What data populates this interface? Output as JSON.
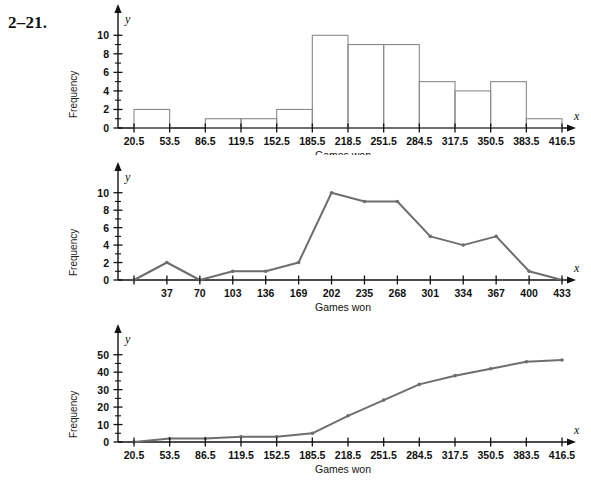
{
  "exercise": {
    "label": "2–21."
  },
  "axis_letters": {
    "x": "x",
    "y": "y"
  },
  "common": {
    "ylabel": "Frequency",
    "xlabel": "Games won"
  },
  "chart_data": [
    {
      "type": "bar",
      "name": "histogram",
      "title": "",
      "xlabel": "Games won",
      "ylabel": "Frequency",
      "boundaries": [
        20.5,
        53.5,
        86.5,
        119.5,
        152.5,
        185.5,
        218.5,
        251.5,
        284.5,
        317.5,
        350.5,
        383.5,
        416.5
      ],
      "tick_labels": [
        "20.5",
        "53.5",
        "86.5",
        "119.5",
        "152.5",
        "185.5",
        "218.5",
        "251.5",
        "284.5",
        "317.5",
        "350.5",
        "383.5",
        "416.5"
      ],
      "categories": [
        "20.5-53.5",
        "53.5-86.5",
        "86.5-119.5",
        "119.5-152.5",
        "152.5-185.5",
        "185.5-218.5",
        "218.5-251.5",
        "251.5-284.5",
        "284.5-317.5",
        "317.5-350.5",
        "350.5-383.5",
        "383.5-416.5"
      ],
      "values": [
        2,
        0,
        1,
        1,
        2,
        10,
        9,
        9,
        5,
        4,
        5,
        1
      ],
      "ylim": [
        0,
        11
      ],
      "ytick_labels": [
        "0",
        "2",
        "4",
        "6",
        "8",
        "10"
      ],
      "yticks": [
        0,
        2,
        4,
        6,
        8,
        10
      ],
      "yminor": [
        1,
        3,
        5,
        7,
        9
      ],
      "grid": false,
      "legend": "none"
    },
    {
      "type": "line",
      "name": "frequency-polygon",
      "title": "",
      "xlabel": "Games won",
      "ylabel": "Frequency",
      "x": [
        4,
        37,
        70,
        103,
        136,
        169,
        202,
        235,
        268,
        301,
        334,
        367,
        400,
        433
      ],
      "tick_labels": [
        "",
        "37",
        "70",
        "103",
        "136",
        "169",
        "202",
        "235",
        "268",
        "301",
        "334",
        "367",
        "400",
        "433"
      ],
      "values": [
        0,
        2,
        0,
        1,
        1,
        2,
        10,
        9,
        9,
        5,
        4,
        5,
        1,
        0
      ],
      "ylim": [
        0,
        11
      ],
      "ytick_labels": [
        "0",
        "2",
        "4",
        "6",
        "8",
        "10"
      ],
      "yticks": [
        0,
        2,
        4,
        6,
        8,
        10
      ],
      "yminor": [
        1,
        3,
        5,
        7,
        9
      ],
      "grid": false,
      "legend": "none"
    },
    {
      "type": "line",
      "name": "ogive",
      "title": "",
      "xlabel": "Games won",
      "ylabel": "Frequency",
      "x": [
        20.5,
        53.5,
        86.5,
        119.5,
        152.5,
        185.5,
        218.5,
        251.5,
        284.5,
        317.5,
        350.5,
        383.5,
        416.5
      ],
      "tick_labels": [
        "20.5",
        "53.5",
        "86.5",
        "119.5",
        "152.5",
        "185.5",
        "218.5",
        "251.5",
        "284.5",
        "317.5",
        "350.5",
        "383.5",
        "416.5"
      ],
      "values": [
        0,
        2,
        2,
        3,
        3,
        5,
        15,
        24,
        33,
        38,
        42,
        46,
        47
      ],
      "ylim": [
        0,
        55
      ],
      "ytick_labels": [
        "0",
        "10",
        "20",
        "30",
        "40",
        "50"
      ],
      "yticks": [
        0,
        10,
        20,
        30,
        40,
        50
      ],
      "yminor": [
        5,
        15,
        25,
        35,
        45
      ],
      "grid": false,
      "legend": "none"
    }
  ],
  "colors": {
    "line": "#6e6e6e",
    "bar_stroke": "#8a8a8a",
    "axis": "#111111",
    "text": "#111111"
  }
}
